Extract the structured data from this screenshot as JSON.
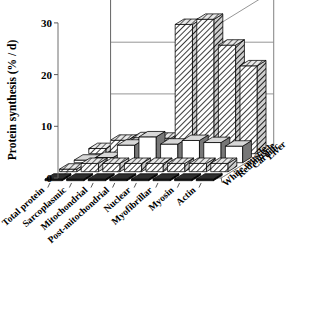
{
  "chart_data": {
    "type": "bar",
    "subtype": "3d-grouped-bar",
    "title": "",
    "xlabel": "",
    "ylabel": "Protein synthesis (% / d)",
    "zlabel": "",
    "ylim": [
      0,
      30
    ],
    "yticks": [
      0,
      10,
      20,
      30
    ],
    "ytick_labels": [
      "0",
      "10",
      "20",
      "30"
    ],
    "grid": true,
    "legend": "none",
    "categories": [
      "Total protein",
      "Sarcoplasmic",
      "Mitochondrial",
      "Post-mitochondrial",
      "Nuclear",
      "Myofibrillar",
      "Myosin",
      "Actin"
    ],
    "depth_categories": [
      "White muscle",
      "Red muscle",
      "Cardiac",
      "Liver"
    ],
    "series": [
      {
        "name": "White muscle",
        "pattern": "solid-black",
        "color": "#111111",
        "values": [
          0.3,
          0.3,
          0.3,
          0.3,
          0.3,
          0.3,
          0.3,
          0.3
        ]
      },
      {
        "name": "Red muscle",
        "pattern": "diagonal-hatch",
        "color": "#ffffff",
        "values": [
          0.5,
          1.6,
          1.6,
          1.6,
          1.6,
          1.6,
          1.6,
          1.6
        ]
      },
      {
        "name": "Cardiac",
        "pattern": "open-white",
        "color": "#ffffff",
        "values": [
          0.5,
          1.0,
          3.4,
          5.0,
          3.6,
          4.3,
          3.9,
          3.2
        ]
      },
      {
        "name": "Liver",
        "pattern": "diagonal-hatch-dense",
        "color": "#ffffff",
        "values": [
          1.0,
          2.6,
          3.1,
          3.0,
          25.0,
          26.0,
          21.0,
          17.0
        ]
      }
    ]
  },
  "axes": {
    "y_title": "Protein synthesis (% / d)"
  }
}
